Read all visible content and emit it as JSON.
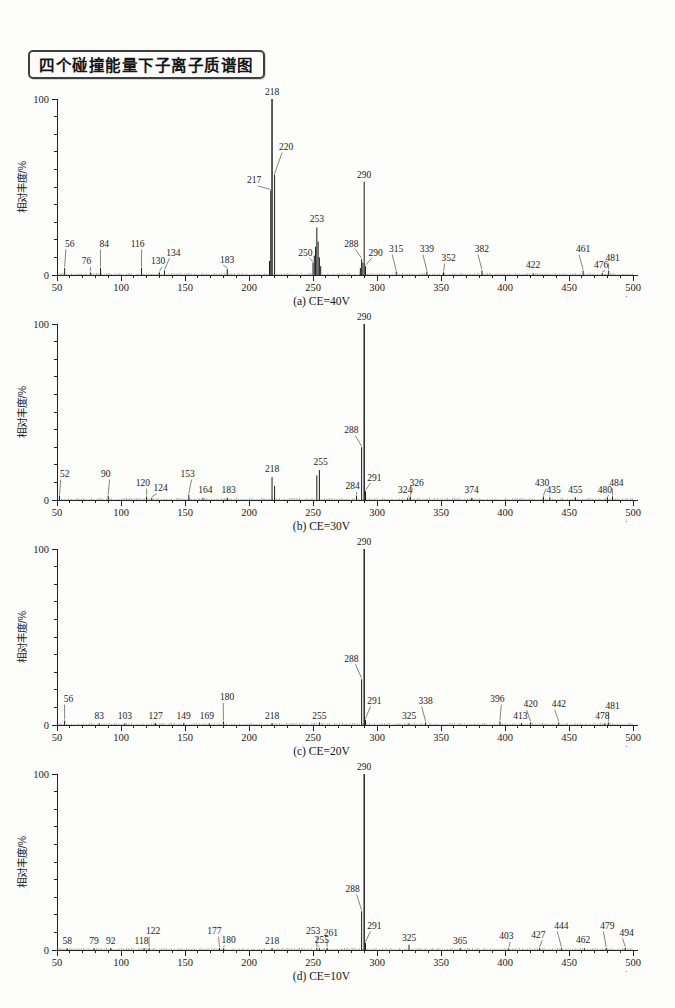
{
  "header": {
    "title": "四个碰撞能量下子离子质谱图"
  },
  "chart_data": [
    {
      "type": "bar",
      "caption": "(a) CE=40V",
      "xlabel": "m/z",
      "ylabel": "相对丰度/%",
      "xlim": [
        50,
        500
      ],
      "ylim": [
        0,
        100
      ],
      "x_major_tick_step": 50,
      "x_minor_tick_step": 10,
      "y_tick_step": 10,
      "y_tick_labels": [
        "0",
        "100"
      ],
      "grid": "off",
      "peaks": [
        [
          56,
          4
        ],
        [
          76,
          1.5
        ],
        [
          84,
          4
        ],
        [
          116,
          4
        ],
        [
          130,
          1.5
        ],
        [
          134,
          2.5
        ],
        [
          183,
          3.5
        ],
        [
          216,
          8
        ],
        [
          217,
          48
        ],
        [
          218,
          100
        ],
        [
          220,
          57
        ],
        [
          250,
          7
        ],
        [
          251,
          11
        ],
        [
          252,
          16
        ],
        [
          253,
          27
        ],
        [
          254,
          19
        ],
        [
          255,
          10
        ],
        [
          256,
          5
        ],
        [
          287,
          4
        ],
        [
          288,
          9
        ],
        [
          289,
          7
        ],
        [
          290,
          53
        ],
        [
          291,
          5
        ],
        [
          315,
          2
        ],
        [
          339,
          2
        ],
        [
          352,
          1.5
        ],
        [
          382,
          2.5
        ],
        [
          422,
          1
        ],
        [
          461,
          2.5
        ],
        [
          476,
          1.2
        ],
        [
          481,
          2.5
        ]
      ],
      "labels": [
        {
          "t": "56",
          "lx": 60,
          "ly": 16,
          "p": 56,
          "ld": true
        },
        {
          "t": "76",
          "lx": 73,
          "ly": 6,
          "p": 76,
          "ld": true
        },
        {
          "t": "84",
          "lx": 87,
          "ly": 16,
          "p": 84,
          "ld": true
        },
        {
          "t": "116",
          "lx": 113,
          "ly": 16,
          "p": 116,
          "ld": true
        },
        {
          "t": "130",
          "lx": 129,
          "ly": 6,
          "p": 130,
          "ld": true
        },
        {
          "t": "134",
          "lx": 141,
          "ly": 11,
          "p": 134,
          "ld": true
        },
        {
          "t": "183",
          "lx": 183,
          "ly": 7,
          "p": 183,
          "ld": true
        },
        {
          "t": "217",
          "lx": 204,
          "ly": 52,
          "p": 217,
          "ld": true
        },
        {
          "t": "218",
          "lx": 218,
          "ly": 102,
          "p": 218,
          "ld": false
        },
        {
          "t": "220",
          "lx": 229,
          "ly": 71,
          "p": 220,
          "ld": true
        },
        {
          "t": "250",
          "lx": 244,
          "ly": 11,
          "p": 250,
          "ld": true
        },
        {
          "t": "253",
          "lx": 253,
          "ly": 30,
          "p": 253,
          "ld": false
        },
        {
          "t": "288",
          "lx": 280,
          "ly": 16,
          "p": 288,
          "ld": true
        },
        {
          "t": "290",
          "lx": 290,
          "ly": 55,
          "p": 290,
          "ld": false
        },
        {
          "t": "290",
          "lx": 299,
          "ly": 11,
          "p": 291,
          "ld": true
        },
        {
          "t": "315",
          "lx": 315,
          "ly": 13,
          "p": 315,
          "ld": true
        },
        {
          "t": "339",
          "lx": 339,
          "ly": 13,
          "p": 339,
          "ld": true
        },
        {
          "t": "352",
          "lx": 356,
          "ly": 8,
          "p": 352,
          "ld": true
        },
        {
          "t": "382",
          "lx": 382,
          "ly": 13,
          "p": 382,
          "ld": true
        },
        {
          "t": "422",
          "lx": 422,
          "ly": 4,
          "p": 422,
          "ld": false
        },
        {
          "t": "461",
          "lx": 461,
          "ly": 13,
          "p": 461,
          "ld": true
        },
        {
          "t": "476",
          "lx": 475,
          "ly": 4,
          "p": 476,
          "ld": true
        },
        {
          "t": "481",
          "lx": 484,
          "ly": 8,
          "p": 481,
          "ld": true
        }
      ]
    },
    {
      "type": "bar",
      "caption": "(b) CE=30V",
      "xlabel": "m/z",
      "ylabel": "相对丰度/%",
      "xlim": [
        50,
        500
      ],
      "ylim": [
        0,
        100
      ],
      "x_major_tick_step": 50,
      "x_minor_tick_step": 10,
      "y_tick_step": 10,
      "y_tick_labels": [
        "0",
        "100"
      ],
      "grid": "off",
      "peaks": [
        [
          52,
          2.5
        ],
        [
          90,
          2.5
        ],
        [
          120,
          2
        ],
        [
          124,
          1.2
        ],
        [
          153,
          3
        ],
        [
          164,
          1.2
        ],
        [
          183,
          1.2
        ],
        [
          218,
          13
        ],
        [
          220,
          8
        ],
        [
          253,
          14
        ],
        [
          255,
          17
        ],
        [
          284,
          2.5
        ],
        [
          288,
          30
        ],
        [
          290,
          100
        ],
        [
          291,
          5
        ],
        [
          324,
          1.2
        ],
        [
          326,
          2
        ],
        [
          374,
          1.2
        ],
        [
          430,
          2
        ],
        [
          435,
          1.5
        ],
        [
          455,
          1.5
        ],
        [
          480,
          1.5
        ],
        [
          484,
          2
        ]
      ],
      "labels": [
        {
          "t": "52",
          "lx": 56,
          "ly": 13,
          "p": 52,
          "ld": true
        },
        {
          "t": "90",
          "lx": 88,
          "ly": 13,
          "p": 90,
          "ld": true
        },
        {
          "t": "120",
          "lx": 117,
          "ly": 8,
          "p": 120,
          "ld": true
        },
        {
          "t": "124",
          "lx": 131,
          "ly": 5,
          "p": 124,
          "ld": true
        },
        {
          "t": "153",
          "lx": 152,
          "ly": 13,
          "p": 153,
          "ld": true
        },
        {
          "t": "164",
          "lx": 166,
          "ly": 4,
          "p": 164,
          "ld": false
        },
        {
          "t": "183",
          "lx": 184,
          "ly": 4,
          "p": 183,
          "ld": false
        },
        {
          "t": "218",
          "lx": 218,
          "ly": 16,
          "p": 218,
          "ld": false
        },
        {
          "t": "255",
          "lx": 256,
          "ly": 20,
          "p": 255,
          "ld": false
        },
        {
          "t": "284",
          "lx": 281,
          "ly": 6,
          "p": 284,
          "ld": true
        },
        {
          "t": "288",
          "lx": 280,
          "ly": 38,
          "p": 288,
          "ld": true
        },
        {
          "t": "290",
          "lx": 290,
          "ly": 102,
          "p": 290,
          "ld": false
        },
        {
          "t": "291",
          "lx": 298,
          "ly": 11,
          "p": 291,
          "ld": true
        },
        {
          "t": "324",
          "lx": 322,
          "ly": 4,
          "p": 324,
          "ld": true
        },
        {
          "t": "326",
          "lx": 331,
          "ly": 8,
          "p": 326,
          "ld": true
        },
        {
          "t": "374",
          "lx": 374,
          "ly": 4,
          "p": 374,
          "ld": false
        },
        {
          "t": "430",
          "lx": 429,
          "ly": 8,
          "p": 430,
          "ld": true
        },
        {
          "t": "435",
          "lx": 438,
          "ly": 4,
          "p": 435,
          "ld": true
        },
        {
          "t": "455",
          "lx": 455,
          "ly": 4,
          "p": 455,
          "ld": false
        },
        {
          "t": "480",
          "lx": 478,
          "ly": 4,
          "p": 480,
          "ld": true
        },
        {
          "t": "484",
          "lx": 487,
          "ly": 8,
          "p": 484,
          "ld": true
        }
      ]
    },
    {
      "type": "bar",
      "caption": "(c) CE=20V",
      "xlabel": "m/z",
      "ylabel": "相对丰度/%",
      "xlim": [
        50,
        500
      ],
      "ylim": [
        0,
        100
      ],
      "x_major_tick_step": 50,
      "x_minor_tick_step": 10,
      "y_tick_step": 10,
      "y_tick_labels": [
        "0",
        "100"
      ],
      "grid": "off",
      "peaks": [
        [
          56,
          2.5
        ],
        [
          83,
          1
        ],
        [
          103,
          1
        ],
        [
          127,
          1
        ],
        [
          149,
          1
        ],
        [
          169,
          1
        ],
        [
          180,
          2
        ],
        [
          218,
          1
        ],
        [
          255,
          1.5
        ],
        [
          288,
          26
        ],
        [
          290,
          100
        ],
        [
          291,
          3
        ],
        [
          325,
          1
        ],
        [
          338,
          1.5
        ],
        [
          396,
          2
        ],
        [
          413,
          1
        ],
        [
          420,
          1.5
        ],
        [
          442,
          1.5
        ],
        [
          478,
          1
        ],
        [
          481,
          1.5
        ]
      ],
      "labels": [
        {
          "t": "56",
          "lx": 59,
          "ly": 13,
          "p": 56,
          "ld": true
        },
        {
          "t": "83",
          "lx": 83,
          "ly": 3.5,
          "p": 83,
          "ld": false
        },
        {
          "t": "103",
          "lx": 103,
          "ly": 3.5,
          "p": 103,
          "ld": false
        },
        {
          "t": "127",
          "lx": 127,
          "ly": 3.5,
          "p": 127,
          "ld": false
        },
        {
          "t": "149",
          "lx": 149,
          "ly": 3.5,
          "p": 149,
          "ld": false
        },
        {
          "t": "169",
          "lx": 167,
          "ly": 3.5,
          "p": 169,
          "ld": false
        },
        {
          "t": "180",
          "lx": 183,
          "ly": 14,
          "p": 180,
          "ld": true
        },
        {
          "t": "218",
          "lx": 218,
          "ly": 3.5,
          "p": 218,
          "ld": false
        },
        {
          "t": "255",
          "lx": 255,
          "ly": 3.5,
          "p": 255,
          "ld": false
        },
        {
          "t": "288",
          "lx": 280,
          "ly": 36,
          "p": 288,
          "ld": true
        },
        {
          "t": "290",
          "lx": 290,
          "ly": 102,
          "p": 290,
          "ld": false
        },
        {
          "t": "291",
          "lx": 298,
          "ly": 12,
          "p": 291,
          "ld": true
        },
        {
          "t": "325",
          "lx": 325,
          "ly": 3.5,
          "p": 325,
          "ld": false
        },
        {
          "t": "338",
          "lx": 338,
          "ly": 12,
          "p": 338,
          "ld": true
        },
        {
          "t": "396",
          "lx": 394,
          "ly": 13,
          "p": 396,
          "ld": true
        },
        {
          "t": "413",
          "lx": 412,
          "ly": 3.5,
          "p": 413,
          "ld": false
        },
        {
          "t": "420",
          "lx": 420,
          "ly": 10,
          "p": 420,
          "ld": true
        },
        {
          "t": "442",
          "lx": 442,
          "ly": 10,
          "p": 442,
          "ld": true
        },
        {
          "t": "478",
          "lx": 476,
          "ly": 3.5,
          "p": 478,
          "ld": false
        },
        {
          "t": "481",
          "lx": 484,
          "ly": 9,
          "p": 481,
          "ld": true
        }
      ]
    },
    {
      "type": "bar",
      "caption": "(d) CE=10V",
      "xlabel": "m/z",
      "ylabel": "相对丰度/%",
      "xlim": [
        50,
        500
      ],
      "ylim": [
        0,
        100
      ],
      "x_major_tick_step": 50,
      "x_minor_tick_step": 10,
      "y_tick_step": 10,
      "y_tick_labels": [
        "0",
        "100"
      ],
      "grid": "off",
      "peaks": [
        [
          58,
          1
        ],
        [
          79,
          1
        ],
        [
          92,
          1
        ],
        [
          118,
          1
        ],
        [
          122,
          1.2
        ],
        [
          177,
          1.2
        ],
        [
          180,
          1
        ],
        [
          218,
          1
        ],
        [
          253,
          1.2
        ],
        [
          255,
          1
        ],
        [
          261,
          1.2
        ],
        [
          288,
          22
        ],
        [
          290,
          100
        ],
        [
          291,
          4
        ],
        [
          325,
          3
        ],
        [
          365,
          1
        ],
        [
          403,
          1
        ],
        [
          427,
          1
        ],
        [
          444,
          1.2
        ],
        [
          462,
          1
        ],
        [
          479,
          1.2
        ],
        [
          494,
          1.2
        ]
      ],
      "labels": [
        {
          "t": "58",
          "lx": 58,
          "ly": 3.5,
          "p": 58,
          "ld": false
        },
        {
          "t": "79",
          "lx": 79,
          "ly": 3.5,
          "p": 79,
          "ld": false
        },
        {
          "t": "92",
          "lx": 92,
          "ly": 3.5,
          "p": 92,
          "ld": false
        },
        {
          "t": "118",
          "lx": 116,
          "ly": 3.5,
          "p": 118,
          "ld": false
        },
        {
          "t": "122",
          "lx": 125,
          "ly": 9,
          "p": 122,
          "ld": true
        },
        {
          "t": "177",
          "lx": 173,
          "ly": 9,
          "p": 177,
          "ld": true
        },
        {
          "t": "180",
          "lx": 184,
          "ly": 4,
          "p": 180,
          "ld": true
        },
        {
          "t": "218",
          "lx": 218,
          "ly": 3.5,
          "p": 218,
          "ld": false
        },
        {
          "t": "253",
          "lx": 250,
          "ly": 9,
          "p": 253,
          "ld": true
        },
        {
          "t": "255",
          "lx": 257,
          "ly": 4,
          "p": 255,
          "ld": true
        },
        {
          "t": "261",
          "lx": 264,
          "ly": 8,
          "p": 261,
          "ld": true
        },
        {
          "t": "288",
          "lx": 281,
          "ly": 33,
          "p": 288,
          "ld": true
        },
        {
          "t": "290",
          "lx": 290,
          "ly": 102,
          "p": 290,
          "ld": false
        },
        {
          "t": "291",
          "lx": 298,
          "ly": 12,
          "p": 291,
          "ld": true
        },
        {
          "t": "325",
          "lx": 325,
          "ly": 5,
          "p": 325,
          "ld": false
        },
        {
          "t": "365",
          "lx": 365,
          "ly": 3.5,
          "p": 365,
          "ld": false
        },
        {
          "t": "403",
          "lx": 401,
          "ly": 6,
          "p": 403,
          "ld": true
        },
        {
          "t": "427",
          "lx": 426,
          "ly": 7,
          "p": 427,
          "ld": true
        },
        {
          "t": "444",
          "lx": 444,
          "ly": 12,
          "p": 444,
          "ld": true
        },
        {
          "t": "462",
          "lx": 461,
          "ly": 4,
          "p": 462,
          "ld": false
        },
        {
          "t": "479",
          "lx": 480,
          "ly": 12,
          "p": 479,
          "ld": true
        },
        {
          "t": "494",
          "lx": 495,
          "ly": 8,
          "p": 494,
          "ld": true
        }
      ]
    }
  ],
  "colors": {
    "ink": "#1a1a1a",
    "axis": "#222222",
    "leader": "#333333",
    "noise": "#555555",
    "page": "#fdfdfc"
  }
}
